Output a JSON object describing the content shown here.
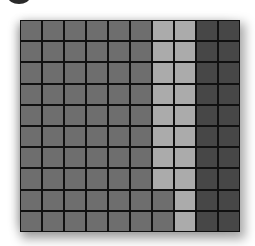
{
  "colors": {
    "medium": "#6e6e6e",
    "light": "#ababab",
    "dark": "#474747",
    "gridline": "#111111"
  },
  "grid": {
    "rows": 10,
    "cols": 10,
    "cells": [
      [
        "medium",
        "medium",
        "medium",
        "medium",
        "medium",
        "medium",
        "light",
        "light",
        "dark",
        "dark"
      ],
      [
        "medium",
        "medium",
        "medium",
        "medium",
        "medium",
        "medium",
        "light",
        "light",
        "dark",
        "dark"
      ],
      [
        "medium",
        "medium",
        "medium",
        "medium",
        "medium",
        "medium",
        "light",
        "light",
        "dark",
        "dark"
      ],
      [
        "medium",
        "medium",
        "medium",
        "medium",
        "medium",
        "medium",
        "light",
        "light",
        "dark",
        "dark"
      ],
      [
        "medium",
        "medium",
        "medium",
        "medium",
        "medium",
        "medium",
        "light",
        "light",
        "dark",
        "dark"
      ],
      [
        "medium",
        "medium",
        "medium",
        "medium",
        "medium",
        "medium",
        "light",
        "light",
        "dark",
        "dark"
      ],
      [
        "medium",
        "medium",
        "medium",
        "medium",
        "medium",
        "medium",
        "light",
        "light",
        "dark",
        "dark"
      ],
      [
        "medium",
        "medium",
        "medium",
        "medium",
        "medium",
        "medium",
        "light",
        "light",
        "dark",
        "dark"
      ],
      [
        "medium",
        "medium",
        "medium",
        "medium",
        "medium",
        "medium",
        "medium",
        "light",
        "dark",
        "dark"
      ],
      [
        "medium",
        "medium",
        "medium",
        "medium",
        "medium",
        "medium",
        "medium",
        "light",
        "dark",
        "dark"
      ]
    ]
  }
}
